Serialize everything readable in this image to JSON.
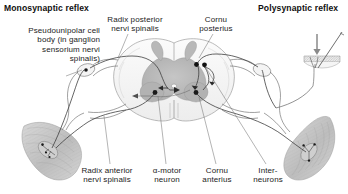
{
  "figure": {
    "title_left": "Monosynaptic reflex",
    "title_right": "Polysynaptic reflex",
    "style": "grayscale anatomical line drawing"
  },
  "headings": [
    {
      "id": "monosynaptic",
      "text": "Monosynaptic reflex",
      "x": 4,
      "y": 4
    },
    {
      "id": "polysynaptic",
      "text": "Polysynaptic reflex",
      "x": 258,
      "y": 4
    }
  ],
  "labels": [
    {
      "id": "pseudounipolar-cell-body",
      "text": "Pseudounipolar cell\nbody (in ganglion\nsensorium nervi\nspinalis)",
      "align": "right",
      "x": 2,
      "y": 26,
      "w": 98
    },
    {
      "id": "radix-posterior",
      "text": "Radix posterior\nnervi spinalis",
      "align": "center",
      "x": 98,
      "y": 15,
      "w": 74
    },
    {
      "id": "cornu-posterius",
      "text": "Cornu\nposterius",
      "align": "center",
      "x": 190,
      "y": 15,
      "w": 52
    },
    {
      "id": "radix-anterior",
      "text": "Radix anterior\nnervi spinalis",
      "align": "center",
      "x": 72,
      "y": 166,
      "w": 70
    },
    {
      "id": "alpha-motor-neuron",
      "text": "α-motor\nneuron",
      "align": "center",
      "x": 146,
      "y": 166,
      "w": 42
    },
    {
      "id": "cornu-anterius",
      "text": "Cornu\nanterius",
      "align": "center",
      "x": 196,
      "y": 166,
      "w": 42
    },
    {
      "id": "interneurons",
      "text": "Inter-\nneurons",
      "align": "center",
      "x": 246,
      "y": 166,
      "w": 44
    }
  ],
  "anatomy": {
    "spinal_cord": {
      "name": "spinal-cord-cross-section",
      "gray_matter": "butterfly-shaped central gray matter",
      "white_matter": "surrounding white matter"
    },
    "structures": [
      {
        "id": "muscle-spindle-left",
        "type": "skeletal-muscle-with-spindle",
        "side": "left"
      },
      {
        "id": "muscle-spindle-right",
        "type": "skeletal-muscle-with-spindle",
        "side": "right"
      },
      {
        "id": "dorsal-root-ganglion-left",
        "type": "ganglion-swelling",
        "side": "left"
      },
      {
        "id": "dorsal-root-ganglion-right",
        "type": "ganglion-swelling",
        "side": "right"
      },
      {
        "id": "nociceptor-skin-icon",
        "type": "skin-with-pin-prick-stimulus",
        "side": "right"
      }
    ],
    "neurons": [
      {
        "id": "afferent-neuron",
        "pathway": "muscle-spindle to posterior horn"
      },
      {
        "id": "interneuron-1",
        "pathway": "posterior horn to anterior horn"
      },
      {
        "id": "interneuron-2",
        "pathway": "posterior horn to anterior horn"
      },
      {
        "id": "alpha-motor-neuron-cell",
        "pathway": "anterior horn to muscle"
      }
    ]
  },
  "colors": {
    "ink": "#4a4a4a",
    "gray_matter": "#b6b6b6",
    "white_matter": "#f2f2f2",
    "muscle": "#c4c4c4",
    "cell_body": "#111111",
    "text": "#232323",
    "background": "#ffffff"
  }
}
